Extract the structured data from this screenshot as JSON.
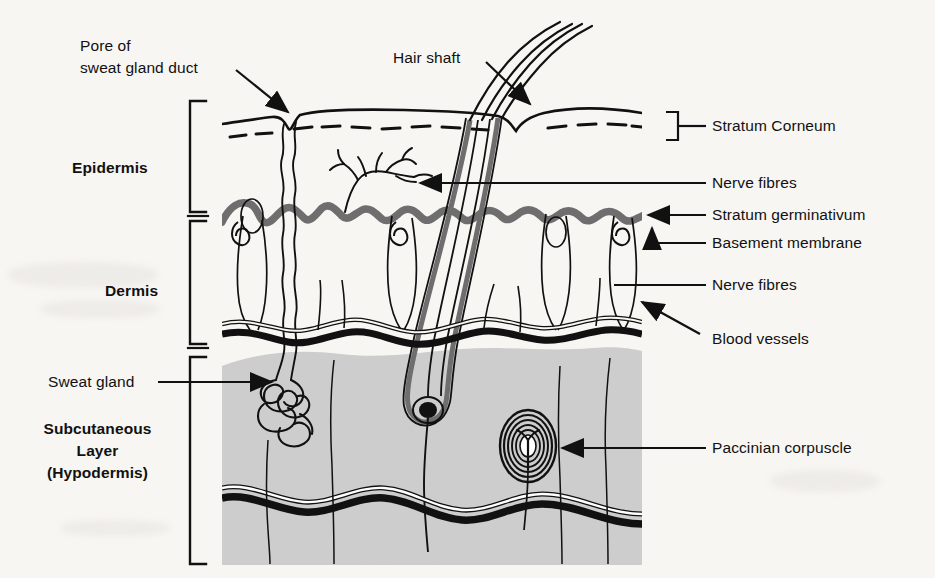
{
  "diagram": {
    "type": "anatomical-cross-section",
    "background_color": "#f7f6f3",
    "ink_color": "#111111",
    "subcutaneous_fill": "#cdcdcd",
    "stratum_germinativum_color": "#6e6e6e"
  },
  "layer_labels": [
    {
      "id": "epidermis",
      "text": "Epidermis"
    },
    {
      "id": "dermis",
      "text": "Dermis"
    },
    {
      "id": "subcutaneous",
      "line1": "Subcutaneous",
      "line2": "Layer",
      "line3": "(Hypodermis)"
    }
  ],
  "callouts": {
    "pore": {
      "line1": "Pore of",
      "line2": "sweat gland duct",
      "connector": "arrow"
    },
    "hair_shaft": {
      "text": "Hair shaft",
      "connector": "arrow"
    },
    "sweat_gland": {
      "text": "Sweat gland",
      "connector": "arrow"
    },
    "stratum_corneum": {
      "text": "Stratum Corneum",
      "connector": "bracket"
    },
    "nerve_fibres_upper": {
      "text": "Nerve fibres",
      "connector": "line"
    },
    "stratum_germinativum": {
      "text": "Stratum germinativum",
      "connector": "arrow"
    },
    "basement_membrane": {
      "text": "Basement membrane",
      "connector": "elbow"
    },
    "nerve_fibres_lower": {
      "text": "Nerve fibres",
      "connector": "line"
    },
    "blood_vessels": {
      "text": "Blood vessels",
      "connector": "arrow"
    },
    "paccinian_corpuscle": {
      "text": "Paccinian corpuscle",
      "connector": "line"
    }
  },
  "structures": [
    "skin-surface",
    "stratum-corneum-dashes",
    "sweat-duct",
    "hair-shaft",
    "hair-follicle",
    "hair-bulb",
    "stratum-germinativum",
    "dermal-papillae",
    "capillary-loops",
    "free-nerve-endings",
    "blood-vessel-plexus",
    "sweat-gland-coil",
    "paccinian-corpuscle",
    "deep-vessels"
  ]
}
